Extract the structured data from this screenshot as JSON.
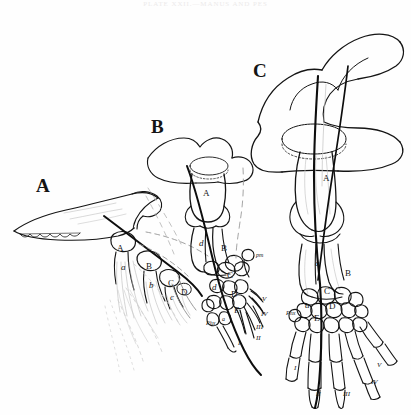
{
  "page": {
    "header_text": "PLATE XXII.—MANUS AND PES",
    "background_color": "#fefefe",
    "ink_color": "#141414"
  },
  "figures": [
    {
      "id": "A",
      "label": "A",
      "label_x": 36,
      "label_y": 175,
      "bone_labels": [
        {
          "text": "A",
          "x": 117,
          "y": 243,
          "style": "cap"
        },
        {
          "text": "a",
          "x": 121,
          "y": 262,
          "style": "italic"
        },
        {
          "text": "B",
          "x": 146,
          "y": 261,
          "style": "cap"
        },
        {
          "text": "b",
          "x": 149,
          "y": 280,
          "style": "italic"
        },
        {
          "text": "C",
          "x": 168,
          "y": 278,
          "style": "cap"
        },
        {
          "text": "c",
          "x": 170,
          "y": 292,
          "style": "italic"
        },
        {
          "text": "D",
          "x": 181,
          "y": 287,
          "style": "cap"
        }
      ],
      "digit_numerals": []
    },
    {
      "id": "B",
      "label": "B",
      "label_x": 151,
      "label_y": 116,
      "bone_labels": [
        {
          "text": "A",
          "x": 203,
          "y": 188,
          "style": "cap"
        },
        {
          "text": "d",
          "x": 199,
          "y": 238,
          "style": "italic"
        },
        {
          "text": "B",
          "x": 221,
          "y": 243,
          "style": "cap"
        },
        {
          "text": "C",
          "x": 227,
          "y": 270,
          "style": "cap"
        },
        {
          "text": "d",
          "x": 212,
          "y": 282,
          "style": "italic"
        },
        {
          "text": "D",
          "x": 231,
          "y": 289,
          "style": "cap"
        },
        {
          "text": "E",
          "x": 234,
          "y": 305,
          "style": "cap"
        },
        {
          "text": "pm",
          "x": 256,
          "y": 252,
          "style": "italic"
        },
        {
          "text": "Phx",
          "x": 208,
          "y": 320,
          "style": "italic"
        },
        {
          "text": "a",
          "x": 222,
          "y": 316,
          "style": "italic"
        }
      ],
      "digit_numerals": [
        {
          "text": "V",
          "x": 262,
          "y": 297
        },
        {
          "text": "IV",
          "x": 262,
          "y": 312
        },
        {
          "text": "III",
          "x": 258,
          "y": 325
        },
        {
          "text": "II",
          "x": 258,
          "y": 337
        },
        {
          "text": "I",
          "x": 240,
          "y": 341
        }
      ]
    },
    {
      "id": "C",
      "label": "C",
      "label_x": 253,
      "label_y": 60,
      "bone_labels": [
        {
          "text": "A",
          "x": 323,
          "y": 173,
          "style": "cap"
        },
        {
          "text": "a",
          "x": 315,
          "y": 258,
          "style": "italic"
        },
        {
          "text": "B",
          "x": 345,
          "y": 268,
          "style": "cap"
        },
        {
          "text": "C",
          "x": 324,
          "y": 288,
          "style": "cap"
        },
        {
          "text": "a",
          "x": 305,
          "y": 300,
          "style": "italic"
        },
        {
          "text": "D",
          "x": 329,
          "y": 303,
          "style": "cap"
        },
        {
          "text": "E",
          "x": 314,
          "y": 315,
          "style": "cap"
        },
        {
          "text": "Phx",
          "x": 288,
          "y": 313,
          "style": "italic"
        }
      ],
      "digit_numerals": [
        {
          "text": "I",
          "x": 296,
          "y": 366
        },
        {
          "text": "II",
          "x": 318,
          "y": 390
        },
        {
          "text": "III",
          "x": 344,
          "y": 390
        },
        {
          "text": "IV",
          "x": 371,
          "y": 380
        },
        {
          "text": "V",
          "x": 376,
          "y": 364
        }
      ]
    }
  ],
  "legend_keys": {
    "A": "propterygium / humerus",
    "B": "mesopterygium / radius",
    "C": "metapterygium / ulna",
    "D": "carpal element",
    "E": "distal carpal",
    "pm": "postminimus",
    "Phx": "phalanx",
    "I": "digit I",
    "II": "digit II",
    "III": "digit III",
    "IV": "digit IV",
    "V": "digit V"
  }
}
